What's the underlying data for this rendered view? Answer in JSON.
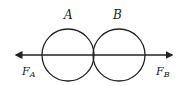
{
  "diagram": {
    "title": "",
    "line_color": "#222222",
    "background": "#ffffff",
    "bodies": [
      {
        "label": "A",
        "cx": 68,
        "cy": 55,
        "r": 26
      },
      {
        "label": "B",
        "cx": 119,
        "cy": 55,
        "r": 26
      }
    ],
    "axis": {
      "x1": 14,
      "x2": 174,
      "y": 55,
      "arrow_left": true,
      "arrow_right": true
    },
    "forces": [
      {
        "symbol": "F",
        "subscript": "A",
        "x": 22,
        "y": 75,
        "direction": "left"
      },
      {
        "symbol": "F",
        "subscript": "B",
        "x": 156,
        "y": 75,
        "direction": "right"
      }
    ]
  }
}
